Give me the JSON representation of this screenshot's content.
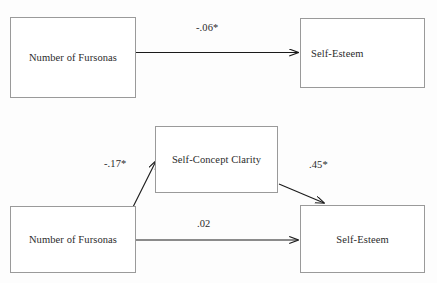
{
  "figure": {
    "type": "path-diagram",
    "background_color": "#fdfdfd",
    "box_border_color": "#9a9a9a",
    "arrow_color": "#1a1a1a",
    "text_color": "#2b2b2b"
  },
  "panels": [
    {
      "id": "panel-total-effect",
      "nodes": [
        {
          "id": "predictor-top",
          "label": "Number of Fursonas",
          "align": "center"
        },
        {
          "id": "outcome-top",
          "label": "Self-Esteem",
          "align": "left"
        }
      ],
      "paths": [
        {
          "id": "path-total",
          "from": "predictor-top",
          "to": "outcome-top",
          "coefficient": "-.06*",
          "significant": true,
          "style": "straight"
        }
      ]
    },
    {
      "id": "panel-mediation",
      "nodes": [
        {
          "id": "predictor-bottom",
          "label": "Number of Fursonas",
          "align": "center"
        },
        {
          "id": "mediator",
          "label": "Self-Concept Clarity",
          "align": "center"
        },
        {
          "id": "outcome-bottom",
          "label": "Self-Esteem",
          "align": "center"
        }
      ],
      "paths": [
        {
          "id": "path-a",
          "from": "predictor-bottom",
          "to": "mediator",
          "coefficient": "-.17*",
          "significant": true,
          "style": "diagonal-up"
        },
        {
          "id": "path-b",
          "from": "mediator",
          "to": "outcome-bottom",
          "coefficient": ".45*",
          "significant": true,
          "style": "diagonal-down"
        },
        {
          "id": "path-c-prime",
          "from": "predictor-bottom",
          "to": "outcome-bottom",
          "coefficient": ".02",
          "significant": false,
          "style": "straight"
        }
      ]
    }
  ]
}
